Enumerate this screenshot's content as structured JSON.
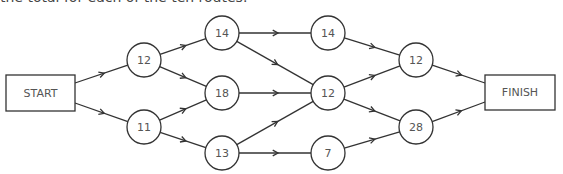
{
  "caption": "the total for each of the ten routes.",
  "diagram": {
    "boxes": [
      {
        "id": "start",
        "label": "START",
        "x": 6,
        "y": 75,
        "w": 69,
        "h": 36
      },
      {
        "id": "finish",
        "label": "FINISH",
        "x": 485,
        "y": 75,
        "w": 70,
        "h": 35
      }
    ],
    "nodes": [
      {
        "id": "a",
        "label": "12",
        "cx": 144,
        "cy": 60
      },
      {
        "id": "b",
        "label": "11",
        "cx": 144,
        "cy": 127
      },
      {
        "id": "c",
        "label": "14",
        "cx": 222,
        "cy": 33
      },
      {
        "id": "d",
        "label": "18",
        "cx": 222,
        "cy": 93
      },
      {
        "id": "e",
        "label": "13",
        "cx": 222,
        "cy": 153
      },
      {
        "id": "f",
        "label": "14",
        "cx": 328,
        "cy": 33
      },
      {
        "id": "g",
        "label": "12",
        "cx": 328,
        "cy": 93
      },
      {
        "id": "h",
        "label": "7",
        "cx": 328,
        "cy": 153
      },
      {
        "id": "i",
        "label": "12",
        "cx": 416,
        "cy": 60
      },
      {
        "id": "j",
        "label": "28",
        "cx": 416,
        "cy": 127
      }
    ],
    "radius": 17,
    "edges": [
      [
        "start",
        "a"
      ],
      [
        "start",
        "b"
      ],
      [
        "a",
        "c"
      ],
      [
        "a",
        "d"
      ],
      [
        "b",
        "d"
      ],
      [
        "b",
        "e"
      ],
      [
        "c",
        "f"
      ],
      [
        "c",
        "g"
      ],
      [
        "d",
        "g"
      ],
      [
        "e",
        "g"
      ],
      [
        "e",
        "h"
      ],
      [
        "f",
        "i"
      ],
      [
        "g",
        "i"
      ],
      [
        "g",
        "j"
      ],
      [
        "h",
        "j"
      ],
      [
        "i",
        "finish"
      ],
      [
        "j",
        "finish"
      ]
    ]
  }
}
